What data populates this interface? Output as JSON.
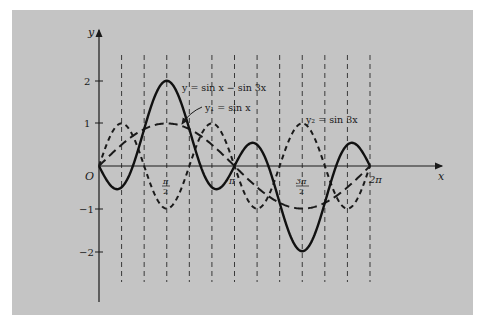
{
  "chart_data": {
    "type": "line",
    "title": "",
    "xlabel": "x",
    "ylabel": "y",
    "origin_label": "O",
    "x_range": [
      0,
      6.2832
    ],
    "y_range": [
      -2.5,
      2.5
    ],
    "x_ticks": [
      {
        "value": 1.5708,
        "label_num": "π",
        "label_den": "2"
      },
      {
        "value": 3.1416,
        "label": "π"
      },
      {
        "value": 4.7124,
        "label_num": "3π",
        "label_den": "2"
      },
      {
        "value": 6.2832,
        "label": "2π"
      }
    ],
    "y_ticks": [
      {
        "value": 2,
        "label": "2"
      },
      {
        "value": 1,
        "label": "1"
      },
      {
        "value": -1,
        "label": "−1"
      },
      {
        "value": -2,
        "label": "−2"
      }
    ],
    "vertical_guides": "dashed lines at x = kπ/6, k = 1..12",
    "grid": false,
    "series": [
      {
        "name": "y = sin x − sin 3x",
        "style": "solid",
        "formula": "sin(x)-sin(3x)"
      },
      {
        "name": "y₁ = sin x",
        "style": "long-dash",
        "formula": "sin(x)"
      },
      {
        "name": "y₂ = sin 3x",
        "style": "short-dash",
        "formula": "sin(3x)"
      }
    ],
    "annotations": [
      {
        "text": "y = sin x − sin 3x",
        "near": "peak at x=π/2, y=2"
      },
      {
        "text": "y₁ = sin x",
        "near": "x≈π/2, y≈1, leader arrow"
      },
      {
        "text": "y₂ = sin 3x",
        "near": "peak at x=3π/2, y=1"
      }
    ]
  },
  "labels": {
    "y_axis": "y",
    "x_axis": "x",
    "origin": "O",
    "y2": "2",
    "y1": "1",
    "ym1": "−1",
    "ym2": "−2",
    "pi_half_num": "π",
    "pi_half_den": "2",
    "pi": "π",
    "three_pi_half_num": "3π",
    "three_pi_half_den": "2",
    "two_pi": "2π",
    "curve_sum": "y = sin x − sin 3x",
    "curve_y1": "y₁ = sin x",
    "curve_y2": "y₂ = sin 3x"
  }
}
